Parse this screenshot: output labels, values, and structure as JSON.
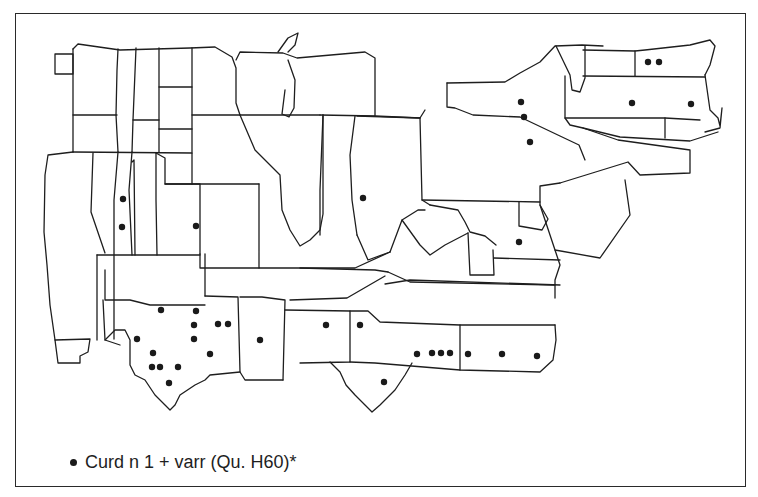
{
  "map": {
    "legend": {
      "symbol": "filled-dot",
      "label": "Curd n 1 + varr (Qu. H60)*"
    },
    "colors": {
      "line": "#1e1e1e",
      "dot": "#1a1a1a",
      "background": "#ffffff"
    },
    "points": [
      [
        123,
        199
      ],
      [
        122,
        227
      ],
      [
        196,
        226
      ],
      [
        363,
        198
      ],
      [
        521,
        102
      ],
      [
        524,
        117
      ],
      [
        530,
        142
      ],
      [
        519,
        242
      ],
      [
        648,
        62
      ],
      [
        659,
        62
      ],
      [
        632,
        103
      ],
      [
        691,
        104
      ],
      [
        161,
        310
      ],
      [
        196,
        311
      ],
      [
        218,
        324
      ],
      [
        228,
        324
      ],
      [
        194,
        325
      ],
      [
        137,
        339
      ],
      [
        194,
        339
      ],
      [
        210,
        354
      ],
      [
        153,
        353
      ],
      [
        152,
        367
      ],
      [
        160,
        367
      ],
      [
        178,
        367
      ],
      [
        169,
        383
      ],
      [
        260,
        340
      ],
      [
        326,
        325
      ],
      [
        360,
        325
      ],
      [
        384,
        382
      ],
      [
        417,
        354
      ],
      [
        432,
        353
      ],
      [
        441,
        353
      ],
      [
        450,
        353
      ],
      [
        468,
        354
      ],
      [
        502,
        354
      ],
      [
        537,
        356
      ]
    ]
  }
}
